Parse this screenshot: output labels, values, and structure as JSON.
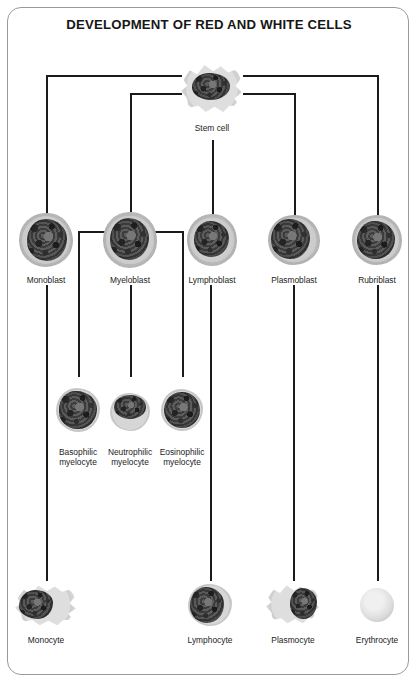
{
  "diagram": {
    "title": "DEVELOPMENT OF RED AND WHITE CELLS",
    "type": "hierarchy",
    "line_color": "#1a1a1a",
    "frame_color": "#9a9a9a",
    "background": "#ffffff"
  },
  "nodes": {
    "stem_cell": {
      "label": "Stem cell",
      "icon": "stem-cell-micrograph",
      "cx": 212,
      "cy": 88,
      "w": 62,
      "h": 52
    },
    "monoblast": {
      "label": "Monoblast",
      "icon": "monoblast-micrograph",
      "cx": 46,
      "cy": 240,
      "w": 54,
      "h": 54
    },
    "myeloblast": {
      "label": "Myeloblast",
      "icon": "myeloblast-micrograph",
      "cx": 130,
      "cy": 240,
      "w": 54,
      "h": 56
    },
    "lymphoblast": {
      "label": "Lymphoblast",
      "icon": "lymphoblast-micrograph",
      "cx": 212,
      "cy": 240,
      "w": 50,
      "h": 52
    },
    "plasmoblast": {
      "label": "Plasmoblast",
      "icon": "plasmoblast-micrograph",
      "cx": 294,
      "cy": 240,
      "w": 52,
      "h": 50
    },
    "rubriblast": {
      "label": "Rubriblast",
      "icon": "rubriblast-micrograph",
      "cx": 377,
      "cy": 240,
      "w": 50,
      "h": 50
    },
    "basophilic_myelocyte": {
      "label": "Basophilic\nmyelocyte",
      "icon": "basophilic-myelocyte-micrograph",
      "cx": 78,
      "cy": 410,
      "w": 44,
      "h": 44
    },
    "neutrophilic_myelocyte": {
      "label": "Neutrophilic\nmyelocyte",
      "icon": "neutrophilic-myelocyte-micrograph",
      "cx": 130,
      "cy": 412,
      "w": 40,
      "h": 38
    },
    "eosinophilic_myelocyte": {
      "label": "Eosinophilic\nmyelocyte",
      "icon": "eosinophilic-myelocyte-micrograph",
      "cx": 182,
      "cy": 410,
      "w": 42,
      "h": 42
    },
    "monocyte": {
      "label": "Monocyte",
      "icon": "monocyte-micrograph",
      "cx": 46,
      "cy": 605,
      "w": 62,
      "h": 44
    },
    "lymphocyte": {
      "label": "Lymphocyte",
      "icon": "lymphocyte-micrograph",
      "cx": 210,
      "cy": 605,
      "w": 44,
      "h": 42
    },
    "plasmocyte": {
      "label": "Plasmocyte",
      "icon": "plasmocyte-micrograph",
      "cx": 293,
      "cy": 604,
      "w": 54,
      "h": 42
    },
    "erythrocyte": {
      "label": "Erythrocyte",
      "icon": "erythrocyte-micrograph",
      "cx": 377,
      "cy": 605,
      "w": 34,
      "h": 34
    }
  },
  "edges": [
    {
      "from": "stem_cell",
      "to": "monoblast"
    },
    {
      "from": "stem_cell",
      "to": "myeloblast"
    },
    {
      "from": "stem_cell",
      "to": "lymphoblast"
    },
    {
      "from": "stem_cell",
      "to": "plasmoblast"
    },
    {
      "from": "stem_cell",
      "to": "rubriblast"
    },
    {
      "from": "myeloblast",
      "to": "basophilic_myelocyte"
    },
    {
      "from": "myeloblast",
      "to": "neutrophilic_myelocyte"
    },
    {
      "from": "myeloblast",
      "to": "eosinophilic_myelocyte"
    },
    {
      "from": "monoblast",
      "to": "monocyte"
    },
    {
      "from": "lymphoblast",
      "to": "lymphocyte"
    },
    {
      "from": "plasmoblast",
      "to": "plasmocyte"
    },
    {
      "from": "rubriblast",
      "to": "erythrocyte"
    }
  ]
}
